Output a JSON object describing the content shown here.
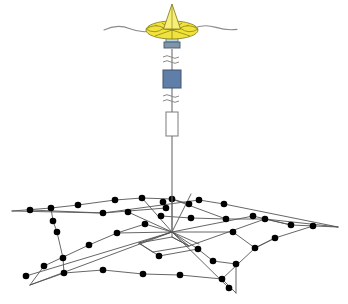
{
  "diagram": {
    "background_color": "#ffffff",
    "width": 348,
    "height": 304
  },
  "colors": {
    "buoy_fill": "#f2e33c",
    "buoy_fill_light": "#f7ef7a",
    "buoy_outline": "#8a8520",
    "collar_fill": "#b9d6e0",
    "collar_outline": "#5d7a88",
    "module_blue_fill": "#5f7fa8",
    "module_blue_outline": "#40546e",
    "module_white_fill": "#ffffff",
    "module_white_outline": "#7b7b7b",
    "cable_stroke": "#6d6d6d",
    "sea_surface_stroke": "#8b8b8b",
    "network_line": "#555555",
    "node_fill": "#000000"
  },
  "sea_surface": {
    "label": "sea-surface-wave-line",
    "stroke_width": 1.1,
    "path": "M 106,30 C 114,26 122,26 130,29 C 137,31.5 144,32 150,31 M 192,28 C 199,25 207,25 215,27.5 C 222,29.7 229,30.4 236,29.6"
  },
  "buoy": {
    "label": "surface-buoy",
    "mast": {
      "apex_x": 172,
      "apex_y": 5,
      "base_left_x": 164,
      "base_left_y": 28,
      "base_right_x": 181,
      "base_right_y": 28
    },
    "disc": {
      "cx": 172,
      "cy": 30,
      "rx": 25,
      "ry": 9
    },
    "petal_lines": 6,
    "collar": {
      "x": 166,
      "y": 36,
      "w": 12,
      "h": 7
    },
    "clamp": {
      "x": 164,
      "y": 43,
      "w": 16,
      "h": 6
    }
  },
  "cable": {
    "label": "mooring-cable",
    "top_x": 172,
    "top_y": 49,
    "bottom_y": 232,
    "stroke_width": 1.1
  },
  "break_symbols": [
    {
      "name": "cable-break-upper",
      "cx": 172,
      "cy": 59,
      "w": 18
    },
    {
      "name": "cable-break-lower",
      "cx": 172,
      "cy": 98,
      "w": 18
    }
  ],
  "instruments": [
    {
      "name": "instrument-module-blue",
      "type": "rectangle",
      "x": 163,
      "y": 70,
      "w": 18,
      "h": 18,
      "fill": "#5f7fa8",
      "stroke": "#40546e"
    },
    {
      "name": "instrument-module-white",
      "type": "rectangle",
      "x": 166,
      "y": 112,
      "w": 12,
      "h": 24,
      "fill": "#ffffff",
      "stroke": "#7b7b7b"
    }
  ],
  "network": {
    "label": "seafloor-sensor-network",
    "line_stroke": "#555555",
    "line_width": 0.9,
    "node_radius": 3.3,
    "node_color": "#000000",
    "anchor_x": 172,
    "anchor_y": 232,
    "nodes": [
      {
        "id": "n01",
        "x": 30,
        "y": 210
      },
      {
        "id": "n02",
        "x": 51,
        "y": 208
      },
      {
        "id": "n03",
        "x": 78,
        "y": 205
      },
      {
        "id": "n04",
        "x": 103,
        "y": 213
      },
      {
        "id": "n05",
        "x": 115,
        "y": 200
      },
      {
        "id": "n06",
        "x": 142,
        "y": 198
      },
      {
        "id": "n07",
        "x": 128,
        "y": 212
      },
      {
        "id": "n08",
        "x": 163,
        "y": 202
      },
      {
        "id": "n09",
        "x": 172,
        "y": 199
      },
      {
        "id": "n10",
        "x": 166,
        "y": 208
      },
      {
        "id": "n11",
        "x": 189,
        "y": 204
      },
      {
        "id": "n12",
        "x": 199,
        "y": 200
      },
      {
        "id": "n13",
        "x": 224,
        "y": 204
      },
      {
        "id": "n14",
        "x": 191,
        "y": 218
      },
      {
        "id": "n15",
        "x": 226,
        "y": 219
      },
      {
        "id": "n16",
        "x": 253,
        "y": 216
      },
      {
        "id": "n17",
        "x": 265,
        "y": 219
      },
      {
        "id": "n18",
        "x": 291,
        "y": 225
      },
      {
        "id": "n19",
        "x": 313,
        "y": 226
      },
      {
        "id": "n20",
        "x": 275,
        "y": 238
      },
      {
        "id": "n21",
        "x": 255,
        "y": 248
      },
      {
        "id": "n22",
        "x": 233,
        "y": 232
      },
      {
        "id": "n23",
        "x": 198,
        "y": 249
      },
      {
        "id": "n24",
        "x": 213,
        "y": 261
      },
      {
        "id": "n25",
        "x": 236,
        "y": 264
      },
      {
        "id": "n26",
        "x": 222,
        "y": 279
      },
      {
        "id": "n27",
        "x": 180,
        "y": 275
      },
      {
        "id": "n28",
        "x": 229,
        "y": 288
      },
      {
        "id": "n29",
        "x": 143,
        "y": 274
      },
      {
        "id": "n30",
        "x": 103,
        "y": 270
      },
      {
        "id": "n31",
        "x": 64,
        "y": 273
      },
      {
        "id": "n32",
        "x": 44,
        "y": 266
      },
      {
        "id": "n33",
        "x": 26,
        "y": 276
      },
      {
        "id": "n34",
        "x": 63,
        "y": 258
      },
      {
        "id": "n35",
        "x": 57,
        "y": 232
      },
      {
        "id": "n36",
        "x": 53,
        "y": 221
      },
      {
        "id": "n37",
        "x": 89,
        "y": 245
      },
      {
        "id": "n38",
        "x": 117,
        "y": 233
      },
      {
        "id": "n39",
        "x": 145,
        "y": 224
      },
      {
        "id": "n40",
        "x": 161,
        "y": 216
      },
      {
        "id": "n41",
        "x": 159,
        "y": 256
      }
    ],
    "edges": [
      {
        "from": "tip-left",
        "to": "n19"
      },
      {
        "from": "tip-left",
        "to": "n33"
      },
      {
        "from": "n01",
        "to": "n13"
      },
      {
        "from": "n03",
        "to": "n09"
      },
      {
        "from": "n19",
        "to": "n33"
      },
      {
        "from": "center",
        "to": "spokes"
      }
    ],
    "tips": [
      {
        "name": "network-tip-left",
        "x": 12,
        "y": 211
      },
      {
        "name": "network-tip-right",
        "x": 338,
        "y": 227
      },
      {
        "name": "network-tip-bottom-left",
        "x": 30,
        "y": 285
      },
      {
        "name": "network-tip-bottom-right",
        "x": 236,
        "y": 293
      }
    ],
    "center_frame": {
      "name": "seafloor-frame-quad",
      "points": "139,243 172,237 189,246 153,252"
    }
  }
}
